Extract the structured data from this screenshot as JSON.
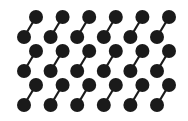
{
  "diagram": {
    "type": "dumbbell-lattice",
    "background": "#ffffff",
    "dot_color": "#1a1a1a",
    "bond_color": "#1a1a1a",
    "columns": 6,
    "rows": 3,
    "col_spacing": 26.6,
    "row_spacing": 34,
    "upper_dot": {
      "x0": 36,
      "y0": 17
    },
    "lower_dot": {
      "x0": 24,
      "y0": 37
    },
    "dot_radius": 7,
    "bond_width": 2.2
  }
}
